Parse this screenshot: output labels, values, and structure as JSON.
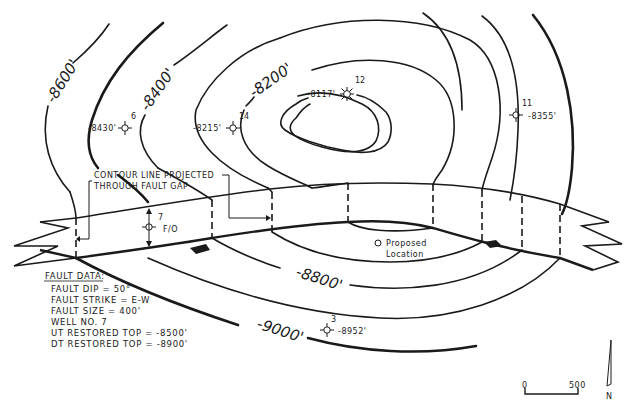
{
  "diagram": {
    "type": "structure-contour-map",
    "contours": [
      {
        "id": "c-8117-closure",
        "label": ""
      },
      {
        "id": "c-8200",
        "label": "-8200'"
      },
      {
        "id": "c-8300",
        "label": ""
      },
      {
        "id": "c-8400",
        "label": "-8400'"
      },
      {
        "id": "c-8500",
        "label": ""
      },
      {
        "id": "c-8600",
        "label": "-8600'"
      },
      {
        "id": "c-8800",
        "label": "-8800'"
      },
      {
        "id": "c-9000",
        "label": "-9000'"
      }
    ],
    "wells": [
      {
        "number": "6",
        "depth": "-8430'",
        "symbol": "oil-well"
      },
      {
        "number": "14",
        "depth": "-8215'",
        "symbol": "oil-well"
      },
      {
        "number": "12",
        "depth": "-8117'",
        "symbol": "gas-well"
      },
      {
        "number": "11",
        "depth": "-8355'",
        "symbol": "oil-well"
      },
      {
        "number": "7",
        "depth": "F/O",
        "symbol": "oil-well"
      },
      {
        "number": "3",
        "depth": "-8952'",
        "symbol": "oil-well"
      }
    ],
    "annotations": {
      "contour_projected_line1": "CONTOUR LINE  PROJECTED",
      "contour_projected_line2": "THROUGH FAULT  GAP",
      "proposed_line1": "Proposed",
      "proposed_line2": "Location"
    },
    "fault_data": {
      "title": "FAULT DATA:",
      "lines": [
        "FAULT  DIP = 50°",
        "FAULT  STRIKE = E-W",
        "FAULT  SIZE = 400'",
        "WELL  NO. 7",
        "UT  RESTORED TOP =  -8500'",
        "DT  RESTORED TOP =  -8900'"
      ]
    },
    "scale_bar": {
      "start": "0",
      "end": "500"
    },
    "north_arrow": {
      "label": "N"
    }
  }
}
